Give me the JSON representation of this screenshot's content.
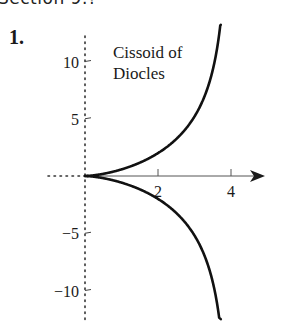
{
  "header": {
    "text": "Section 9.?"
  },
  "problem": {
    "number": "1."
  },
  "chart_data": {
    "type": "line",
    "title": "Cissoid of Diocles",
    "title_lines": [
      "Cissoid of",
      "Diocles"
    ],
    "equation_hint": "y^2 = x^3 / (4 - x)",
    "xlabel": "",
    "ylabel": "",
    "x_ticks": [
      2,
      4
    ],
    "y_ticks": [
      10,
      5,
      -5,
      -10
    ],
    "x_tick_labels": [
      "2",
      "4"
    ],
    "y_tick_labels": [
      "10",
      "5",
      "−5",
      "−10"
    ],
    "xlim": [
      -1.8,
      5
    ],
    "ylim": [
      -12.5,
      13.2
    ],
    "grid": false,
    "y_axis_style": "dotted",
    "x_axis_negative_style": "dotted",
    "series": [
      {
        "name": "upper branch",
        "x": [
          0,
          0.5,
          1,
          1.5,
          2,
          2.5,
          3,
          3.3,
          3.5,
          3.6,
          3.72
        ],
        "y": [
          0,
          0.19,
          0.58,
          1.16,
          2.0,
          3.23,
          5.2,
          7.2,
          9.35,
          10.8,
          13.2
        ]
      },
      {
        "name": "lower branch",
        "x": [
          0,
          0.5,
          1,
          1.5,
          2,
          2.5,
          3,
          3.3,
          3.5,
          3.6,
          3.72
        ],
        "y": [
          0,
          -0.19,
          -0.58,
          -1.16,
          -2.0,
          -3.23,
          -5.2,
          -7.2,
          -9.35,
          -10.8,
          -12.5
        ]
      }
    ]
  }
}
